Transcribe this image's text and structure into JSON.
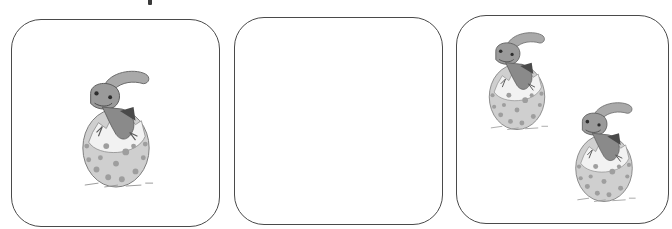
{
  "worksheet": {
    "panels": [
      {
        "id": "panel-1",
        "content": "dinosaur-egg",
        "count": 1
      },
      {
        "id": "panel-2",
        "content": "empty",
        "count": 0
      },
      {
        "id": "panel-3",
        "content": "dinosaur-egg",
        "count": 2
      }
    ],
    "icon": "hatching-dinosaur-egg-icon",
    "colors": {
      "border": "#4a4a4a",
      "background": "#ffffff",
      "egg": "#c9c9c9",
      "egg_spots": "#9a9a9a",
      "dino": "#8c8c8c",
      "dark": "#3a3a3a"
    }
  }
}
